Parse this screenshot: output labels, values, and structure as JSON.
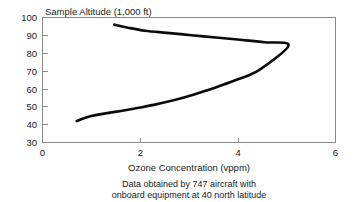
{
  "chart_data": {
    "type": "line",
    "title": "Sample Altitude (1,000 ft)",
    "xlabel": "Ozone Concentration (vppm)",
    "ylabel": "Sample Altitude (1,000 ft)",
    "xlim": [
      0,
      6
    ],
    "ylim": [
      30,
      100
    ],
    "xticks": [
      "0",
      "2",
      "4",
      "6"
    ],
    "yticks": [
      "100",
      "90",
      "80",
      "70",
      "60",
      "50",
      "40",
      "30"
    ],
    "grid": false,
    "legend": null,
    "caption_line_1": "Data obtained by 747 aircraft with",
    "caption_line_2": "onboard equipment at 40 north latitude",
    "series": [
      {
        "name": "Ozone profile",
        "x": [
          0.7,
          0.85,
          1.0,
          1.2,
          1.45,
          1.72,
          2.0,
          2.3,
          2.62,
          2.95,
          3.25,
          3.6,
          4.0,
          4.45,
          5.04,
          4.55,
          4.05,
          3.55,
          3.05,
          2.55,
          2.1,
          1.75,
          1.47
        ],
        "y": [
          42.0,
          43.6,
          44.8,
          45.9,
          47.0,
          48.2,
          49.6,
          51.2,
          53.2,
          55.6,
          58.2,
          61.4,
          65.4,
          70.8,
          84.4,
          86.1,
          87.5,
          88.8,
          90.1,
          91.4,
          92.6,
          94.3,
          96.0
        ]
      }
    ]
  },
  "axis_titles": {
    "x": "Ozone Concentration (vppm)",
    "y_top": "Sample Altitude (1,000 ft)"
  },
  "caption": {
    "line_1": "Data obtained by 747 aircraft with",
    "line_2": "onboard equipment at 40 north latitude"
  },
  "colors": {
    "curve": "#0b0b0b",
    "axis": "#8a8a8a",
    "text": "#1a1a1a",
    "background": "#ffffff"
  }
}
